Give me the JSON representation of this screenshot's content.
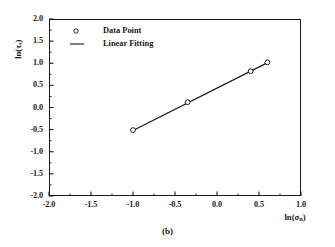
{
  "chart_data": {
    "type": "scatter",
    "title": "",
    "subtitle": "",
    "xlabel": "ln(σn)",
    "xlabel_base": "ln(σ",
    "xlabel_sub": "n",
    "xlabel_close": ")",
    "ylabel": "ln(τs)",
    "ylabel_base": "ln(τ",
    "ylabel_sub": "s",
    "ylabel_close": ")",
    "xlim": [
      -2.0,
      1.0
    ],
    "ylim": [
      -2.0,
      2.0
    ],
    "xticks": [
      "-2.0",
      "-1.5",
      "-1.0",
      "-0.5",
      "0.0",
      "0.5",
      "1.0"
    ],
    "xtick_values": [
      -2.0,
      -1.5,
      -1.0,
      -0.5,
      0.0,
      0.5,
      1.0
    ],
    "yticks": [
      "2.0",
      "1.5",
      "1.0",
      "0.5",
      "0.0",
      "-0.5",
      "-1.0",
      "-1.5",
      "-2.0"
    ],
    "ytick_values": [
      2.0,
      1.5,
      1.0,
      0.5,
      0.0,
      -0.5,
      -1.0,
      -1.5,
      -2.0
    ],
    "grid": false,
    "legend_position": "upper-left",
    "series": [
      {
        "name": "Data Point",
        "type": "scatter",
        "marker": "open-circle",
        "color": "#1a1a1a",
        "x": [
          -1.0,
          -0.35,
          0.4,
          0.6
        ],
        "y": [
          -0.51,
          0.12,
          0.82,
          1.02
        ]
      },
      {
        "name": "Linear Fitting",
        "type": "line",
        "color": "#1a1a1a",
        "x": [
          -1.0,
          0.62
        ],
        "y": [
          -0.52,
          1.03
        ],
        "slope": 0.957,
        "intercept": 0.437
      }
    ],
    "annotations": [
      {
        "text": "(b)",
        "role": "figure-caption",
        "position": "below-axis"
      }
    ]
  },
  "legend": {
    "items": [
      {
        "label": "Data Point",
        "symbol": "open-circle"
      },
      {
        "label": "Linear Fitting",
        "symbol": "line"
      }
    ]
  },
  "caption": {
    "label": "(b)"
  },
  "colors": {
    "axis": "#1a1a1a",
    "data": "#1a1a1a",
    "background": "#ffffff"
  }
}
